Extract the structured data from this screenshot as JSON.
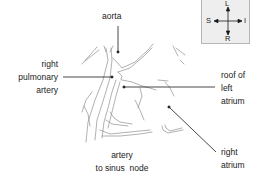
{
  "diagram": {
    "labels": {
      "aorta": "aorta",
      "right_pulmonary_artery": [
        "right",
        "pulmonary",
        "artery"
      ],
      "roof_of_left_atrium": [
        "roof of",
        "left",
        "atrium"
      ],
      "right_atrium": [
        "right",
        "atrium"
      ],
      "artery_to_sinus_node": [
        "artery",
        "to sinus  node"
      ]
    },
    "orientation": {
      "top": "L",
      "left": "S",
      "right": "I",
      "bottom": "R"
    },
    "colors": {
      "line": "#1a1a1a",
      "sketch": "#8a8a8a",
      "compass_bg": "#eeeeee"
    }
  }
}
